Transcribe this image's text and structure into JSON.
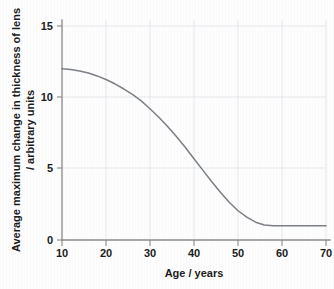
{
  "figure": {
    "background_color": "#fdfdfd",
    "curve_color": "#7b7f86",
    "grid_color": "#d9dde4",
    "axis_color": "#8a8a8a",
    "text_color": "#1c1c1c"
  },
  "axes": {
    "x_title": "Age / years",
    "y_title_line1": "Average maximum change in thickness of lens",
    "y_title_line2": "/ arbitrary units",
    "x_ticks": [
      "10",
      "20",
      "30",
      "40",
      "50",
      "60",
      "70"
    ],
    "y_ticks": [
      "0",
      "5",
      "10",
      "15"
    ]
  },
  "chart_data": {
    "type": "line",
    "title": "",
    "subtitle": "",
    "xlabel": "Age / years",
    "ylabel": "Average maximum change in thickness of lens / arbitrary units",
    "xlim": [
      10,
      70
    ],
    "ylim": [
      0,
      15
    ],
    "xticks": [
      10,
      20,
      30,
      40,
      50,
      60,
      70
    ],
    "yticks": [
      0,
      5,
      10,
      15
    ],
    "grid": true,
    "legend": null,
    "legend_position": "none",
    "annotations": [],
    "series": [
      {
        "name": "Average maximum change in thickness of lens",
        "color": "#7b7f86",
        "x": [
          10,
          12,
          14,
          16,
          18,
          20,
          22,
          24,
          26,
          28,
          30,
          32,
          34,
          36,
          38,
          40,
          42,
          44,
          46,
          48,
          50,
          52,
          54,
          56,
          58,
          60,
          62,
          64,
          66,
          68,
          70
        ],
        "values": [
          12.0,
          11.95,
          11.85,
          11.7,
          11.5,
          11.25,
          10.95,
          10.6,
          10.2,
          9.75,
          9.2,
          8.6,
          7.95,
          7.25,
          6.5,
          5.7,
          4.9,
          4.1,
          3.35,
          2.65,
          2.05,
          1.6,
          1.25,
          1.05,
          1.0,
          1.0,
          1.0,
          1.0,
          1.0,
          1.0,
          1.0
        ]
      }
    ]
  }
}
